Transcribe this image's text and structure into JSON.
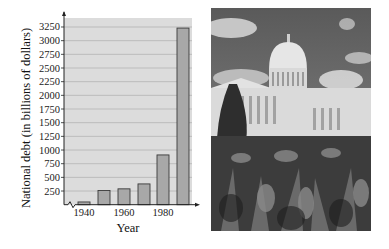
{
  "chart_data": {
    "type": "bar",
    "title": "",
    "xlabel": "Year",
    "ylabel": "National debt (in billions of dollars)",
    "categories": [
      "1940",
      "1950",
      "1960",
      "1970",
      "1980",
      "1990"
    ],
    "values": [
      50,
      260,
      290,
      380,
      910,
      3230
    ],
    "x_tick_labels": [
      "1940",
      "1960",
      "1980"
    ],
    "y_ticks": [
      250,
      500,
      750,
      1000,
      1250,
      1500,
      1750,
      2000,
      2250,
      2500,
      2750,
      3000,
      3250
    ],
    "ylim": [
      0,
      3400
    ],
    "grid": true,
    "axis_break": true,
    "legend": null,
    "colors": {
      "plot_bg": "#dcdcdc",
      "bar": "#a8a8a8",
      "bar_edge": "#3a3a3a",
      "grid": "#b4b4b4"
    }
  },
  "photo": {
    "subject": "US Capitol building with flower garden in foreground",
    "style": "grayscale"
  }
}
